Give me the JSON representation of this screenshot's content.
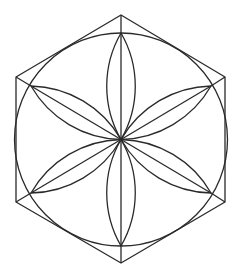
{
  "figure": {
    "stroke_color": "#2a2a2a",
    "background": "#ffffff",
    "center": [
      121,
      139.5
    ],
    "circle_radius": 106.5,
    "hexagon_points": [
      [
        121,
        15
      ],
      [
        225,
        77
      ],
      [
        225,
        202
      ],
      [
        121,
        263
      ],
      [
        16,
        202
      ],
      [
        16,
        77
      ]
    ],
    "petal_tips": [
      [
        121,
        33
      ],
      [
        211,
        86
      ],
      [
        211,
        193
      ],
      [
        121,
        246
      ],
      [
        31,
        193
      ],
      [
        31,
        86
      ]
    ],
    "petal_arc_radius": 106.5
  }
}
